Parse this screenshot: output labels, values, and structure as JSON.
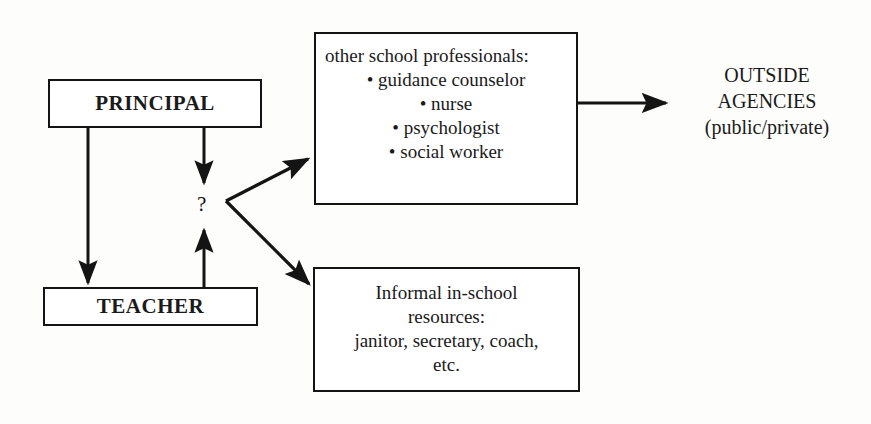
{
  "diagram": {
    "ink_color": "#141414",
    "paper_color": "#fdfdfb",
    "nodes": {
      "principal": {
        "label": "PRINCIPAL"
      },
      "teacher": {
        "label": "TEACHER"
      },
      "professionals": {
        "heading": "other school professionals:",
        "items": [
          "• guidance counselor",
          "• nurse",
          "• psychologist",
          "• social worker"
        ]
      },
      "informal": {
        "line1": "Informal in-school",
        "line2": "resources:",
        "line3": "janitor, secretary, coach,",
        "line4": "etc."
      },
      "outside": {
        "line1": "OUTSIDE",
        "line2": "AGENCIES",
        "line3": "(public/private)"
      }
    },
    "annotations": {
      "question_mark": "?"
    },
    "edges": [
      {
        "name": "principal-to-teacher",
        "from": "principal",
        "to": "teacher",
        "style": "solid-arrow-down"
      },
      {
        "name": "principal-to-question",
        "from": "principal",
        "to": "question-mark",
        "style": "solid-arrow-down"
      },
      {
        "name": "teacher-to-question",
        "from": "teacher",
        "to": "question-mark",
        "style": "solid-arrow-up"
      },
      {
        "name": "question-to-professionals",
        "from": "question-mark",
        "to": "professionals",
        "style": "solid-arrow-diagonal-up"
      },
      {
        "name": "question-to-informal",
        "from": "question-mark",
        "to": "informal",
        "style": "solid-arrow-diagonal-down"
      },
      {
        "name": "professionals-to-outside",
        "from": "professionals",
        "to": "outside",
        "style": "solid-arrow-right"
      }
    ]
  }
}
